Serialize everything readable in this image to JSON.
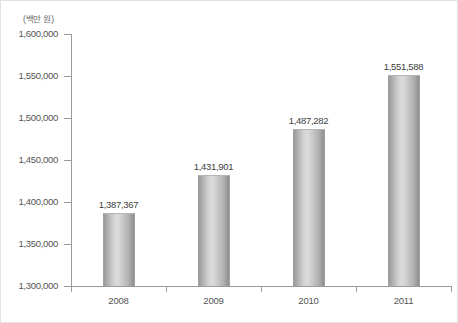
{
  "chart_data": {
    "type": "bar",
    "title": "",
    "subtitle": "",
    "unit_label": "(백만 원)",
    "xlabel": "",
    "ylabel": "",
    "categories": [
      "2008",
      "2009",
      "2010",
      "2011"
    ],
    "values": [
      1387367,
      1431901,
      1487282,
      1551588
    ],
    "value_labels": [
      "1,387,367",
      "1,431,901",
      "1,487,282",
      "1,551,588"
    ],
    "ylim": [
      1300000,
      1600000
    ],
    "ytick_values": [
      1600000,
      1550000,
      1500000,
      1450000,
      1400000,
      1350000,
      1300000
    ],
    "ytick_labels": [
      "1,600,000",
      "1,550,000",
      "1,500,000",
      "1,450,000",
      "1,400,000",
      "1,350,000",
      "1,300,000"
    ],
    "ytick_step": 50000,
    "grid": false,
    "legend": false,
    "legend_position": "none",
    "series": [
      {
        "name": "",
        "values": [
          1387367,
          1431901,
          1487282,
          1551588
        ]
      }
    ],
    "colors": {
      "bar_light": "#dcdcdc",
      "bar_mid": "#c9c9c9",
      "bar_dark": "#8f8f8f",
      "axis": "#9a9a9a",
      "tick_text": "#555555",
      "value_text": "#3e3e3e",
      "frame_border": "#e2e2e2",
      "background": "#ffffff"
    }
  }
}
